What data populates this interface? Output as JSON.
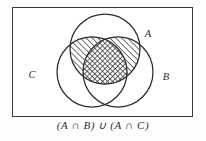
{
  "figure": {
    "caption": "(A ∩ B) ∪ (A ∩ C)",
    "frame": {
      "name": "universal-set-rectangle",
      "x": 12,
      "y": 7,
      "width": 181,
      "height": 110,
      "stroke": "#3a3a3a",
      "fill": "#ffffff"
    },
    "background_color": "#fdfdfd",
    "line_color": "#2b2b2b",
    "hatch_color": "#1f1f1f",
    "circles": [
      {
        "label": "A",
        "name": "circle-set-a",
        "cx": 105,
        "cy": 49,
        "r": 35,
        "label_x": 148,
        "label_y": 37
      },
      {
        "label": "C",
        "name": "circle-set-c",
        "cx": 92,
        "cy": 72,
        "r": 35,
        "label_x": 32,
        "label_y": 78
      },
      {
        "label": "B",
        "name": "circle-set-b",
        "cx": 118,
        "cy": 72,
        "r": 35,
        "label_x": 166,
        "label_y": 80
      }
    ],
    "shaded_regions": [
      {
        "name": "region-a-and-c",
        "description": "A intersect C only",
        "pattern": "diagonal-hatch"
      },
      {
        "name": "region-a-and-b",
        "description": "A intersect B only",
        "pattern": "diagonal-hatch"
      },
      {
        "name": "region-a-and-b-and-c",
        "description": "A intersect B intersect C",
        "pattern": "cross-hatch"
      }
    ],
    "unshaded_regions": [
      {
        "name": "region-b-and-c",
        "description": "B intersect C only"
      },
      {
        "name": "region-a-only",
        "description": "A only"
      },
      {
        "name": "region-b-only",
        "description": "B only"
      },
      {
        "name": "region-c-only",
        "description": "C only"
      },
      {
        "name": "region-universe-only",
        "description": "outside all circles"
      }
    ]
  }
}
